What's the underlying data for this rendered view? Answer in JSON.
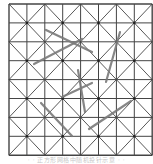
{
  "figure": {
    "type": "grid-with-random-needles",
    "grid": {
      "cols": 8,
      "rows": 8,
      "origin": [
        9,
        4
      ],
      "cell_width": 17.9,
      "cell_height": 18.9,
      "line_color": "#444444",
      "diagonal_pattern": "checkerboard-X",
      "node_dot_color": "#222222"
    },
    "needles": [
      {
        "x1": 46,
        "y1": 30,
        "x2": 92,
        "y2": 52
      },
      {
        "x1": 34,
        "y1": 64,
        "x2": 82,
        "y2": 39
      },
      {
        "x1": 120,
        "y1": 32,
        "x2": 106,
        "y2": 82
      },
      {
        "x1": 78,
        "y1": 70,
        "x2": 85,
        "y2": 112
      },
      {
        "x1": 62,
        "y1": 97,
        "x2": 92,
        "y2": 83
      },
      {
        "x1": 41,
        "y1": 103,
        "x2": 72,
        "y2": 136
      },
      {
        "x1": 89,
        "y1": 129,
        "x2": 131,
        "y2": 101
      }
    ],
    "needle_color": "#7a7a7a"
  },
  "caption": {
    "text": "· · 正方形网格中随机投针示意 · ·"
  }
}
